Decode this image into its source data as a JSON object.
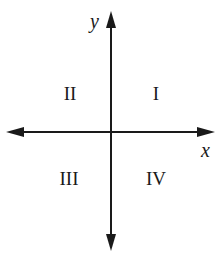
{
  "diagram": {
    "type": "coordinate-plane",
    "axes": {
      "x_label": "x",
      "y_label": "y"
    },
    "quadrants": [
      {
        "id": "I",
        "label": "I"
      },
      {
        "id": "II",
        "label": "II"
      },
      {
        "id": "III",
        "label": "III"
      },
      {
        "id": "IV",
        "label": "IV"
      }
    ],
    "colors": {
      "line": "#1a1a1a",
      "background": "#ffffff"
    }
  }
}
